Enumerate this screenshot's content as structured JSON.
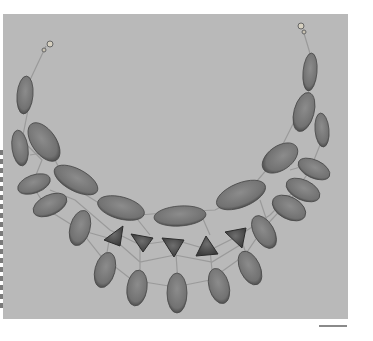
{
  "image": {
    "subject": "necklace",
    "description": "Bib necklace of oval and triangular stones on thin wire network, clasp at both ends",
    "background_color": "#b9b9b9",
    "stone_color": "#7d7d7d",
    "stone_dark": "#4a4a4a",
    "wire_color": "#9a9a9a"
  }
}
